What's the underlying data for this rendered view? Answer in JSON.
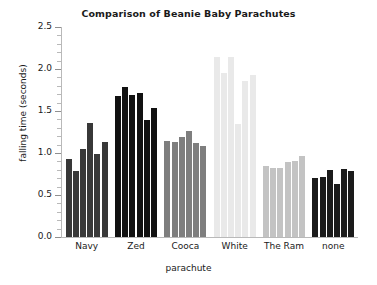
{
  "chart_data": {
    "type": "bar",
    "title": "Comparison of Beanie Baby Parachutes",
    "xlabel": "parachute",
    "ylabel": "falling time (seconds)",
    "ylim": [
      0.0,
      2.5
    ],
    "yticks": [
      "0.0",
      "0.5",
      "1.0",
      "1.5",
      "2.0",
      "2.5"
    ],
    "ytick_values": [
      0.0,
      0.5,
      1.0,
      1.5,
      2.0,
      2.5
    ],
    "minor_tick_step": 0.1,
    "grid": false,
    "legend": "none",
    "categories": [
      "Navy",
      "Zed",
      "Cooca",
      "White",
      "The Ram",
      "none"
    ],
    "groups": [
      {
        "category": "Navy",
        "color": "#383838",
        "values": [
          0.93,
          0.79,
          1.05,
          1.36,
          0.99,
          1.13
        ]
      },
      {
        "category": "Zed",
        "color": "#111111",
        "values": [
          1.68,
          1.79,
          1.69,
          1.71,
          1.39,
          1.54
        ]
      },
      {
        "category": "Cooca",
        "color": "#7e7e7e",
        "values": [
          1.14,
          1.13,
          1.19,
          1.26,
          1.12,
          1.08
        ]
      },
      {
        "category": "White",
        "color": "#e9e9e9",
        "values": [
          2.14,
          1.95,
          2.14,
          1.35,
          1.86,
          1.93
        ]
      },
      {
        "category": "The Ram",
        "color": "#c3c3c3",
        "values": [
          0.85,
          0.82,
          0.82,
          0.89,
          0.9,
          0.96
        ]
      },
      {
        "category": "none",
        "color": "#1b1b1b",
        "values": [
          0.7,
          0.71,
          0.8,
          0.63,
          0.81,
          0.79
        ]
      }
    ]
  }
}
